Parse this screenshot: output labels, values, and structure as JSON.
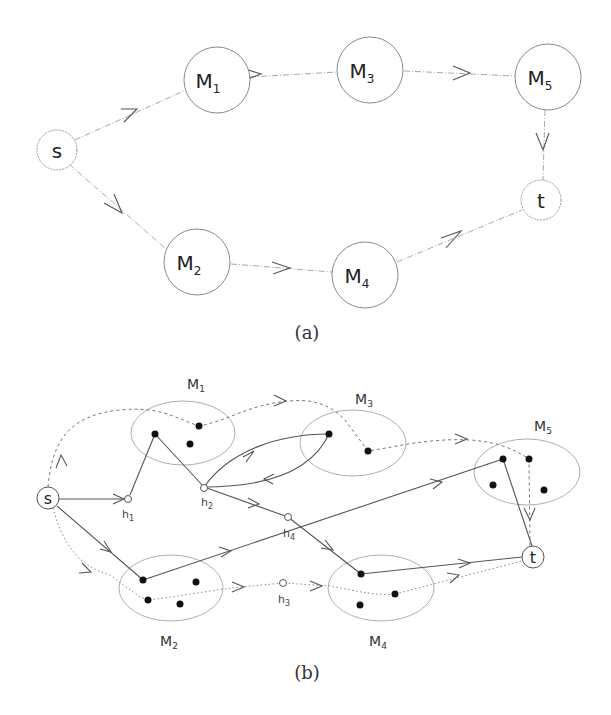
{
  "figure_a": {
    "caption": "(a)",
    "nodes": {
      "s": {
        "label": "s"
      },
      "t": {
        "label": "t"
      },
      "M1": {
        "label": "M",
        "sub": "1"
      },
      "M2": {
        "label": "M",
        "sub": "2"
      },
      "M3": {
        "label": "M",
        "sub": "3"
      },
      "M4": {
        "label": "M",
        "sub": "4"
      },
      "M5": {
        "label": "M",
        "sub": "5"
      }
    },
    "edges": [
      [
        "s",
        "M1"
      ],
      [
        "M1",
        "M3"
      ],
      [
        "M3",
        "M5"
      ],
      [
        "M5",
        "t"
      ],
      [
        "s",
        "M2"
      ],
      [
        "M2",
        "M4"
      ],
      [
        "M4",
        "t"
      ]
    ]
  },
  "figure_b": {
    "caption": "(b)",
    "clusters": {
      "M1": {
        "label": "M",
        "sub": "1",
        "points": 3
      },
      "M2": {
        "label": "M",
        "sub": "2",
        "points": 4
      },
      "M3": {
        "label": "M",
        "sub": "3",
        "points": 2
      },
      "M4": {
        "label": "M",
        "sub": "4",
        "points": 3
      },
      "M5": {
        "label": "M",
        "sub": "5",
        "points": 4
      }
    },
    "terminals": {
      "s": {
        "label": "s"
      },
      "t": {
        "label": "t"
      }
    },
    "hubs": {
      "h1": {
        "label": "h",
        "sub": "1"
      },
      "h2": {
        "label": "h",
        "sub": "2"
      },
      "h3": {
        "label": "h",
        "sub": "3"
      },
      "h4": {
        "label": "h",
        "sub": "4"
      }
    },
    "line_styles": [
      "solid",
      "dashed",
      "dotted"
    ]
  }
}
